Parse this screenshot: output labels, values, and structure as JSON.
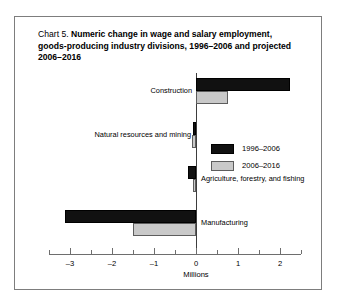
{
  "figure": {
    "title_lead": "Chart 5.",
    "title_main": "Numeric change in wage and salary employment, goods-producing industry divisions, 1996–2006 and projected 2006–2016",
    "border_color": "#7d7d7d",
    "background": "#ffffff"
  },
  "chart_data": {
    "type": "bar",
    "orientation": "horizontal",
    "title": "Chart 5. Numeric change in wage and salary employment, goods-producing industry divisions, 1996–2006 and projected 2006–2016",
    "xlabel": "Millions",
    "ylabel": "",
    "xlim": [
      -3.5,
      2.5
    ],
    "xticks": [
      -3,
      -2,
      -1,
      0,
      1,
      2
    ],
    "xtick_labels": [
      "–3",
      "–2",
      "–1",
      "0",
      "1",
      "2"
    ],
    "minor_xticks": [
      -3.5,
      -2.5,
      -1.5,
      -0.5,
      0.5,
      1.5,
      2.5
    ],
    "grid": false,
    "legend_position": "center",
    "categories": [
      "Construction",
      "Natural resources and mining",
      "Agriculture, forestry, and fishing",
      "Manufacturing"
    ],
    "series": [
      {
        "name": "1996–2006",
        "color": "#111111",
        "values": [
          2.23,
          -0.07,
          -0.18,
          -3.12
        ]
      },
      {
        "name": "2006–2016",
        "color": "#c9c9c9",
        "values": [
          0.76,
          -0.09,
          -0.07,
          -1.5
        ]
      }
    ]
  },
  "legend": {
    "items": [
      {
        "label": "1996–2006",
        "swatch": "black-square-swatch"
      },
      {
        "label": "2006–2016",
        "swatch": "gray-square-swatch"
      }
    ]
  },
  "axis": {
    "units_label": "Millions"
  }
}
